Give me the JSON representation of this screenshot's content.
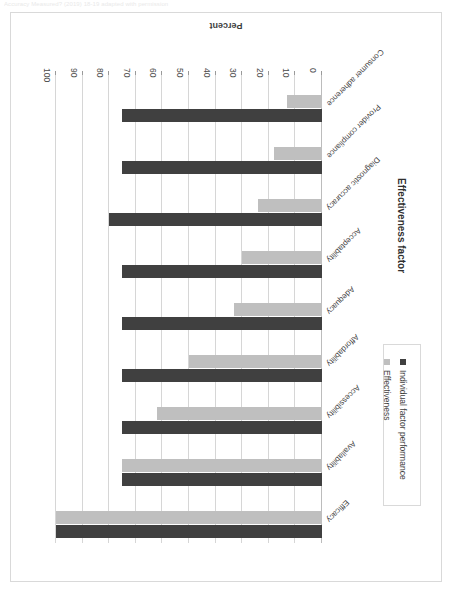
{
  "page": {
    "caption": "Accuracy Measured? (2019) 18-19 adapted with permission"
  },
  "chart_data": {
    "type": "bar",
    "orientation": "horizontal",
    "title": "",
    "xlabel": "Percent",
    "ylabel": "Effectiveness  factor",
    "xlim": [
      0,
      100
    ],
    "xticks": [
      "0",
      "10",
      "20",
      "30",
      "40",
      "50",
      "60",
      "70",
      "80",
      "90",
      "100"
    ],
    "grid": true,
    "legend_position": "bottom-right",
    "categories": [
      "Efficacy",
      "Availability",
      "Accessibility",
      "Affordability",
      "Adequacy",
      "Acceptability",
      "Diagnostic accuracy",
      "Provider compliance",
      "Consumer adherence"
    ],
    "series": [
      {
        "name": "Individual factor performance",
        "color": "#404040",
        "values": [
          100,
          75,
          75,
          75,
          75,
          75,
          80,
          75,
          75
        ]
      },
      {
        "name": "Effectiveness",
        "color": "#bfbfbf",
        "values": [
          100,
          75,
          62,
          50,
          33,
          30,
          24,
          18,
          13
        ]
      }
    ]
  }
}
